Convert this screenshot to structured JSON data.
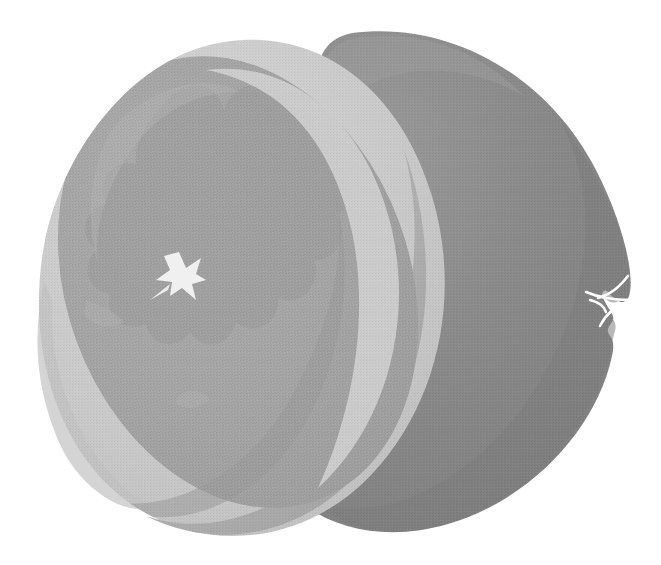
{
  "image": {
    "title": "Halved citrus fruit",
    "subject": "grapefruit-half",
    "style": "grayscale halftone illustration",
    "alt_text": "A grapefruit cut in half, shown in three-quarter perspective with the cut face angled toward the viewer and the uncut rear hemisphere behind it.",
    "background_color": "#ffffff",
    "width": 661,
    "height": 565
  },
  "palette": {
    "background": "#ffffff",
    "rear_hemisphere_dark": "#878787",
    "rear_hemisphere_shadow": "#7d7d7d",
    "rear_hemisphere_light": "#9a9a9a",
    "rind_band_light": "#c9c9c9",
    "rind_band_highlight": "#d2d2d2",
    "rind_edge_mid": "#b4b4b4",
    "flesh_mid": "#a6a6a6",
    "flesh_shadow": "#9c9c9c",
    "flesh_light": "#b0b0b0",
    "cut_side_wall": "#aeaeae",
    "core_star": "#f2f2f2",
    "stem_scar": "#ffffff"
  },
  "parts": [
    {
      "id": "rear-hemisphere",
      "label": "Uncut rear half of fruit",
      "tone": "dark gray"
    },
    {
      "id": "rind-ring",
      "label": "Pale pith and rind ring around the cut face",
      "tone": "light gray"
    },
    {
      "id": "flesh-disc",
      "label": "Cut flesh face with segment scallops",
      "tone": "medium gray"
    },
    {
      "id": "core-star",
      "label": "Star-shaped central core",
      "tone": "near white"
    },
    {
      "id": "stem-scar",
      "label": "Stem scar mark on the rear hemisphere edge",
      "tone": "white"
    },
    {
      "id": "cut-wall",
      "label": "Side wall of the near half below the cut face",
      "tone": "light-medium gray"
    }
  ],
  "geometry": {
    "rear_center": {
      "x": 420,
      "y": 285
    },
    "rear_radius_x": 215,
    "rear_radius_y": 258,
    "cut_face_center": {
      "x": 245,
      "y": 285
    },
    "cut_face_radius_x": 185,
    "cut_face_radius_y": 250,
    "cut_face_rotation_deg": -22,
    "core_star_center": {
      "x": 180,
      "y": 275
    },
    "stem_scar_center": {
      "x": 614,
      "y": 298
    }
  }
}
